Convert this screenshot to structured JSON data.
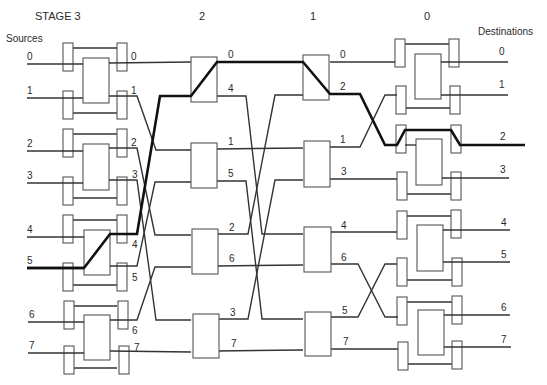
{
  "header": {
    "stage_labels": [
      {
        "text": "STAGE 3",
        "x": 35,
        "y": 20
      },
      {
        "text": "2",
        "x": 199,
        "y": 20
      },
      {
        "text": "1",
        "x": 310,
        "y": 20
      },
      {
        "text": "0",
        "x": 424,
        "y": 20
      }
    ],
    "sources_label": "Sources",
    "destinations_label": "Destinations"
  },
  "sources": [
    {
      "label": "0",
      "y": 64
    },
    {
      "label": "1",
      "y": 98
    },
    {
      "label": "2",
      "y": 151
    },
    {
      "label": "3",
      "y": 183
    },
    {
      "label": "4",
      "y": 237
    },
    {
      "label": "5",
      "y": 268
    },
    {
      "label": "6",
      "y": 322
    },
    {
      "label": "7",
      "y": 353
    }
  ],
  "stage3_outputs": [
    {
      "label": "0",
      "y": 63
    },
    {
      "label": "1",
      "y": 95
    },
    {
      "label": "2",
      "y": 148
    },
    {
      "label": "3",
      "y": 180
    },
    {
      "label": "4",
      "y": 234
    },
    {
      "label": "5",
      "y": 266
    },
    {
      "label": "6",
      "y": 320
    },
    {
      "label": "7",
      "y": 351
    }
  ],
  "stage2_outputs": [
    {
      "label": "0",
      "y": 62
    },
    {
      "label": "4",
      "y": 96
    },
    {
      "label": "1",
      "y": 149
    },
    {
      "label": "5",
      "y": 181
    },
    {
      "label": "2",
      "y": 234
    },
    {
      "label": "6",
      "y": 266
    },
    {
      "label": "3",
      "y": 319
    },
    {
      "label": "7",
      "y": 351
    }
  ],
  "stage1_outputs": [
    {
      "label": "0",
      "y": 62
    },
    {
      "label": "2",
      "y": 94
    },
    {
      "label": "1",
      "y": 147
    },
    {
      "label": "3",
      "y": 179
    },
    {
      "label": "4",
      "y": 232
    },
    {
      "label": "6",
      "y": 264
    },
    {
      "label": "5",
      "y": 317
    },
    {
      "label": "7",
      "y": 349
    }
  ],
  "destinations": [
    {
      "label": "0",
      "y": 62
    },
    {
      "label": "1",
      "y": 95
    },
    {
      "label": "2",
      "y": 145
    },
    {
      "label": "3",
      "y": 178
    },
    {
      "label": "4",
      "y": 230
    },
    {
      "label": "5",
      "y": 262
    },
    {
      "label": "6",
      "y": 315
    },
    {
      "label": "7",
      "y": 347
    }
  ],
  "highlighted_path": {
    "description": "Source 5 routed to Destination 2",
    "source": "5",
    "destination": "2"
  },
  "colors": {
    "line": "#333333",
    "bold_path": "#111111",
    "box_stroke": "#555555",
    "background": "#ffffff"
  }
}
